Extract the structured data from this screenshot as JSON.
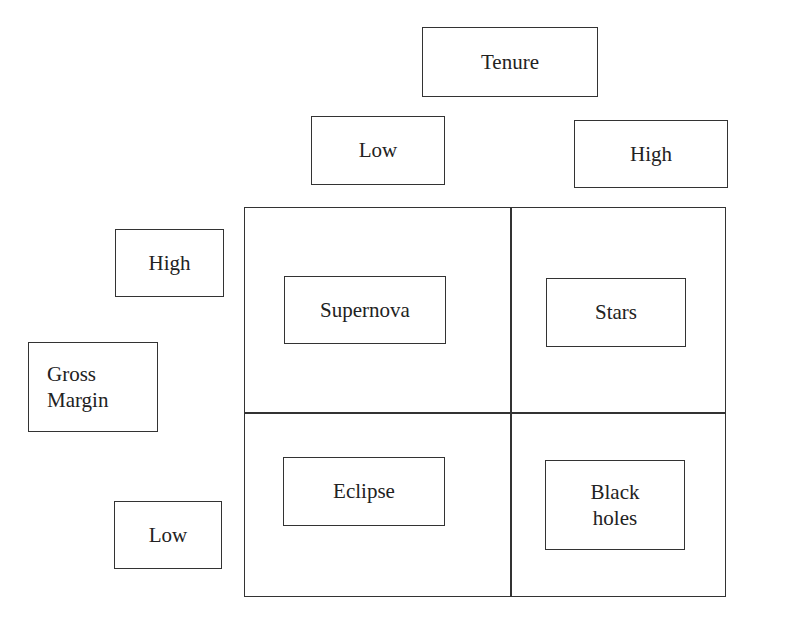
{
  "diagram": {
    "type": "2x2 matrix",
    "x_axis": {
      "title": "Tenure",
      "low_label": "Low",
      "high_label": "High"
    },
    "y_axis": {
      "title": "Gross\nMargin",
      "high_label": "High",
      "low_label": "Low"
    },
    "quadrants": {
      "top_left": "Supernova",
      "top_right": "Stars",
      "bottom_left": "Eclipse",
      "bottom_right": "Black\nholes"
    }
  }
}
